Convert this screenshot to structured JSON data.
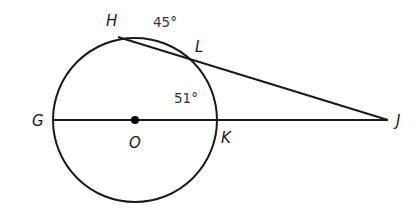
{
  "diagram": {
    "type": "circle-secant-geometry",
    "circle": {
      "center_label": "O",
      "cx": 135,
      "cy": 120,
      "r": 82
    },
    "points": {
      "H": {
        "label": "H",
        "x": 118,
        "y": 37
      },
      "L": {
        "label": "L",
        "x": 191,
        "y": 60
      },
      "G": {
        "label": "G",
        "x": 53,
        "y": 120
      },
      "O": {
        "label": "O",
        "x": 135,
        "y": 120
      },
      "K": {
        "label": "K",
        "x": 216,
        "y": 120
      },
      "J": {
        "label": "J",
        "x": 388,
        "y": 120
      }
    },
    "segments": [
      {
        "from": "H",
        "to": "J"
      },
      {
        "from": "G",
        "to": "J"
      }
    ],
    "arc_labels": {
      "arc_HL": "45°",
      "arc_LK": "51°"
    },
    "colors": {
      "stroke": "#1a1a1a",
      "label": "#1a1a1a",
      "degree_label": "#333333"
    }
  }
}
